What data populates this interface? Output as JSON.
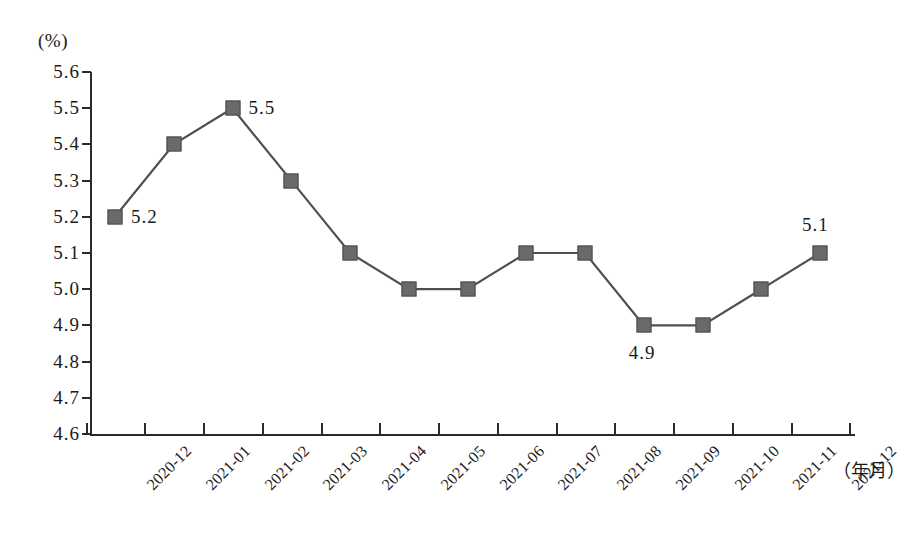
{
  "chart_data": {
    "type": "line",
    "title": "",
    "xlabel": "（年月）",
    "ylabel": "(%)",
    "ylim": [
      4.6,
      5.6
    ],
    "ytick_step": 0.1,
    "grid": false,
    "legend": null,
    "marker_color": "#6a6a6a",
    "line_color": "#4f4f4f",
    "axis_color": "#2b2b2b",
    "categories": [
      "2020-12",
      "2021-01",
      "2021-02",
      "2021-03",
      "2021-04",
      "2021-05",
      "2021-06",
      "2021-07",
      "2021-08",
      "2021-09",
      "2021-10",
      "2021-11",
      "2021-12"
    ],
    "values": [
      5.2,
      5.4,
      5.5,
      5.3,
      5.1,
      5.0,
      5.0,
      5.1,
      5.1,
      4.9,
      4.9,
      5.0,
      5.1
    ],
    "ytick_labels": [
      "5.6",
      "5.5",
      "5.4",
      "5.3",
      "5.2",
      "5.1",
      "5.0",
      "4.9",
      "4.8",
      "4.7",
      "4.6"
    ],
    "ytick_values": [
      5.6,
      5.5,
      5.4,
      5.3,
      5.2,
      5.1,
      5.0,
      4.9,
      4.8,
      4.7,
      4.6
    ],
    "annotations": [
      {
        "index": 0,
        "text": "5.2",
        "position": "right"
      },
      {
        "index": 2,
        "text": "5.5",
        "position": "right"
      },
      {
        "index": 9,
        "text": "4.9",
        "position": "below"
      },
      {
        "index": 12,
        "text": "5.1",
        "position": "above"
      }
    ]
  }
}
